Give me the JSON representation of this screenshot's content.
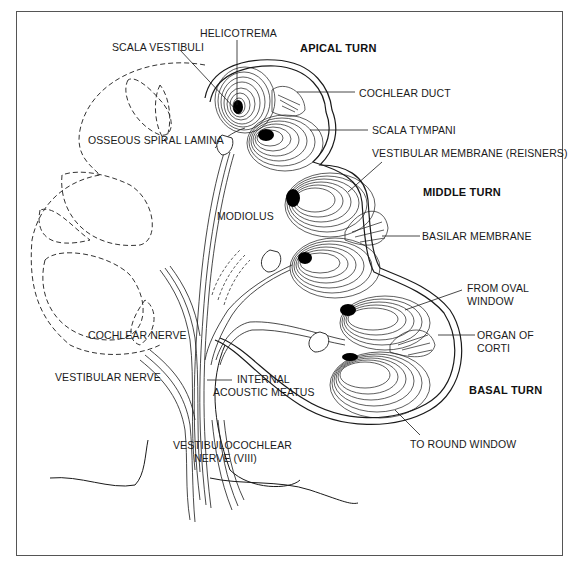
{
  "diagram": {
    "headings": {
      "apical": "APICAL TURN",
      "middle": "MIDDLE TURN",
      "basal": "BASAL TURN"
    },
    "labels": {
      "helicotrema": "HELICOTREMA",
      "scala_vestibuli": "SCALA VESTIBULI",
      "cochlear_duct": "COCHLEAR DUCT",
      "scala_tympani": "SCALA TYMPANI",
      "osseous_spiral_lamina": "OSSEOUS SPIRAL LAMINA",
      "vestibular_membrane": "VESTIBULAR MEMBRANE (REISNERS)",
      "modiolus": "MODIOLUS",
      "basilar_membrane": "BASILAR MEMBRANE",
      "from_oval_window_1": "FROM OVAL",
      "from_oval_window_2": "WINDOW",
      "organ_of_corti_1": "ORGAN OF",
      "organ_of_corti_2": "CORTI",
      "cochlear_nerve": "COCHLEAR NERVE",
      "vestibular_nerve": "VESTIBULAR NERVE",
      "internal_acoustic_meatus_1": "INTERNAL",
      "internal_acoustic_meatus_2": "ACOUSTIC MEATUS",
      "vestibulocochlear_nerve_1": "VESTIBULOCOCHLEAR",
      "vestibulocochlear_nerve_2": "NERVE (VIII)",
      "to_round_window": "TO ROUND WINDOW"
    },
    "colors": {
      "line": "#1a1a1a",
      "frame": "#555555",
      "background": "#ffffff"
    }
  }
}
